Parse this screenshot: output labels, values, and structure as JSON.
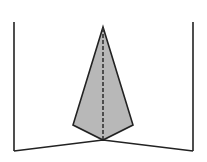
{
  "diagram": {
    "colors": {
      "stroke": "#222222",
      "fill": "#b8b8b8",
      "background": "#ffffff"
    },
    "points": {
      "left_top": [
        14,
        22
      ],
      "left_bottom": [
        14,
        151
      ],
      "right_top": [
        193,
        22
      ],
      "right_bottom": [
        193,
        151
      ],
      "apex": [
        103,
        27
      ],
      "kite_left": [
        73,
        125
      ],
      "kite_right": [
        133,
        125
      ],
      "base": [
        103,
        140
      ]
    }
  }
}
